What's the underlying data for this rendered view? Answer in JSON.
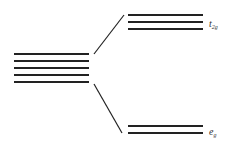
{
  "diagram": {
    "type": "crystal-field-splitting",
    "line_color": "#222222",
    "degenerate_levels": {
      "count": 5,
      "x1": 14,
      "x2": 89,
      "ys": [
        54,
        61,
        68,
        75,
        82
      ]
    },
    "upper_set": {
      "label_main": "t",
      "label_sub": "2g",
      "count": 3,
      "x1": 128,
      "x2": 203,
      "ys": [
        15,
        22,
        29
      ]
    },
    "lower_set": {
      "label_main": "e",
      "label_sub": "g",
      "count": 2,
      "x1": 128,
      "x2": 203,
      "ys": [
        126,
        133
      ]
    },
    "connectors": [
      {
        "x1": 94,
        "y1": 54,
        "x2": 124,
        "y2": 15
      },
      {
        "x1": 94,
        "y1": 84,
        "x2": 122,
        "y2": 133
      }
    ]
  }
}
